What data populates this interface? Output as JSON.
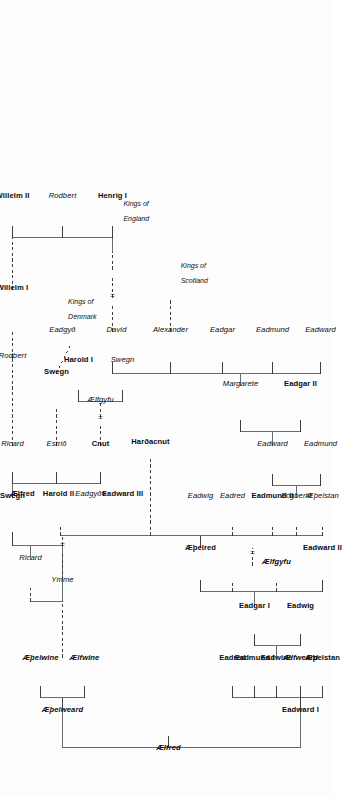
{
  "diagram": {
    "kind": "genealogy-family-tree",
    "orientation": "rotated-90-ccw",
    "root": "Ælfred"
  },
  "dynasty_notes": [
    {
      "id": "kings-of-denmark",
      "line1": "Kings of",
      "line2": "Denmark"
    },
    {
      "id": "kings-of-scotland",
      "line1": "Kings of",
      "line2": "Scotland"
    },
    {
      "id": "kings-of-england",
      "line1": "Kings of",
      "line2": "England"
    }
  ],
  "marriage_symbol": "=",
  "people": [
    {
      "id": "aelfred",
      "name": "Ælfred",
      "style": "bi"
    },
    {
      "id": "eadward-i",
      "name": "Eadward I",
      "style": "b"
    },
    {
      "id": "aethelweard",
      "name": "Æþelweard",
      "style": "bi"
    },
    {
      "id": "aethelstan",
      "name": "Æþelstan",
      "style": "b"
    },
    {
      "id": "aelfweard",
      "name": "Ælfweard",
      "style": "bi"
    },
    {
      "id": "eadwine",
      "name": "Eadwine",
      "style": "b"
    },
    {
      "id": "eadmund-i",
      "name": "Eadmund I",
      "style": "b"
    },
    {
      "id": "eadred",
      "name": "Eadred",
      "style": "b"
    },
    {
      "id": "aelfwine",
      "name": "Ælfwine",
      "style": "bi"
    },
    {
      "id": "aethelwine",
      "name": "Æþelwine",
      "style": "bi"
    },
    {
      "id": "eadwig-1",
      "name": "Eadwig",
      "style": "b"
    },
    {
      "id": "eadgar-i",
      "name": "Eadgar I",
      "style": "b"
    },
    {
      "id": "eadward-ii",
      "name": "Eadward II",
      "style": "b"
    },
    {
      "id": "aelfgyfu",
      "name": "Ælfgyfu",
      "style": "bi"
    },
    {
      "id": "aethelred",
      "name": "Æþelred",
      "style": "b"
    },
    {
      "id": "aethelstan2",
      "name": "Æþelstan",
      "style": "i"
    },
    {
      "id": "ecgberht",
      "name": "Ecgberht",
      "style": "i"
    },
    {
      "id": "eadmund-ii",
      "name": "Eadmund II",
      "style": "b"
    },
    {
      "id": "eadred-2",
      "name": "Eadred",
      "style": "i"
    },
    {
      "id": "eadwig-2",
      "name": "Eadwig",
      "style": "i"
    },
    {
      "id": "ymme",
      "name": "Ymme",
      "style": "i"
    },
    {
      "id": "eadward-iii",
      "name": "Eadward III",
      "style": "b"
    },
    {
      "id": "eadgyth-1",
      "name": "Eadgyð",
      "style": "i"
    },
    {
      "id": "harold-ii",
      "name": "Harold II",
      "style": "b"
    },
    {
      "id": "aelfred-2",
      "name": "Ælfred",
      "style": "b"
    },
    {
      "id": "harthacnut",
      "name": "Harðacnut",
      "style": "b"
    },
    {
      "id": "eadmund-3",
      "name": "Eadmund",
      "style": "i"
    },
    {
      "id": "eadward-4",
      "name": "Eadward",
      "style": "i"
    },
    {
      "id": "eadgar-ii",
      "name": "Eadgar II",
      "style": "b"
    },
    {
      "id": "margarete",
      "name": "Margarete",
      "style": "i"
    },
    {
      "id": "eadward-5",
      "name": "Eadward",
      "style": "i"
    },
    {
      "id": "eadmund-5",
      "name": "Eadmund",
      "style": "i"
    },
    {
      "id": "eadgar-5",
      "name": "Eadgar",
      "style": "i"
    },
    {
      "id": "alexander",
      "name": "Alexander",
      "style": "i"
    },
    {
      "id": "david",
      "name": "David",
      "style": "i"
    },
    {
      "id": "eadgyth-2",
      "name": "Eadgyð",
      "style": "i"
    },
    {
      "id": "ricard-1",
      "name": "Ricard",
      "style": "i"
    },
    {
      "id": "swegn-1",
      "name": "Swegn",
      "style": "b"
    },
    {
      "id": "ricard-2",
      "name": "Ricard",
      "style": "i"
    },
    {
      "id": "cnut",
      "name": "Cnut",
      "style": "b"
    },
    {
      "id": "aelfgyfu-2",
      "name": "Ælfgyfu",
      "style": "i"
    },
    {
      "id": "estrid",
      "name": "Estrið",
      "style": "i"
    },
    {
      "id": "swegn-2",
      "name": "Swegn",
      "style": "b"
    },
    {
      "id": "harold-i",
      "name": "Harold I",
      "style": "b"
    },
    {
      "id": "swegn-3",
      "name": "Swegn",
      "style": "i"
    },
    {
      "id": "rodbert-1",
      "name": "Rodbert",
      "style": "i"
    },
    {
      "id": "willelm-i",
      "name": "Willelm I",
      "style": "b"
    },
    {
      "id": "willelm-ii",
      "name": "Willelm II",
      "style": "b"
    },
    {
      "id": "rodbert-2",
      "name": "Rodbert",
      "style": "i"
    },
    {
      "id": "henrig-i",
      "name": "Henrig I",
      "style": "b"
    }
  ],
  "colors": {
    "ink": "#0b0b0b",
    "rule": "#2a2a2a",
    "page": "#fdfdfd"
  }
}
